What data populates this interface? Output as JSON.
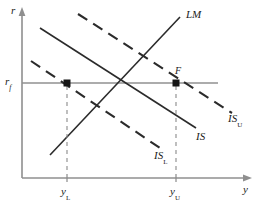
{
  "figure": {
    "type": "is-lm-diagram",
    "background_color": "#ffffff",
    "line_color": "#2b2b2b",
    "axis_color": "#8a8a8a",
    "marker_color": "#1a1a1a"
  },
  "axes": {
    "y_axis_label": "r",
    "x_axis_label": "y",
    "origin_label": ""
  },
  "interest_rate_line": {
    "label_base": "r",
    "label_sub": "f",
    "description": "full-employment interest rate horizontal line"
  },
  "ticks": {
    "x": [
      {
        "base": "y",
        "sub": "L"
      },
      {
        "base": "y",
        "sub": "U"
      }
    ]
  },
  "curves": [
    {
      "name": "IS_U",
      "label_base": "IS",
      "label_sub": "U",
      "style": "dashed",
      "slope": "down"
    },
    {
      "name": "IS",
      "label_base": "IS",
      "label_sub": "",
      "style": "solid",
      "slope": "down"
    },
    {
      "name": "IS_L",
      "label_base": "IS",
      "label_sub": "L",
      "style": "dashed",
      "slope": "down"
    },
    {
      "name": "LM",
      "label_base": "LM",
      "label_sub": "",
      "style": "solid",
      "slope": "up"
    }
  ],
  "points": [
    {
      "name": "F",
      "label": "F",
      "marker": "filled-square"
    },
    {
      "name": "L",
      "label": "",
      "marker": "filled-square"
    }
  ]
}
